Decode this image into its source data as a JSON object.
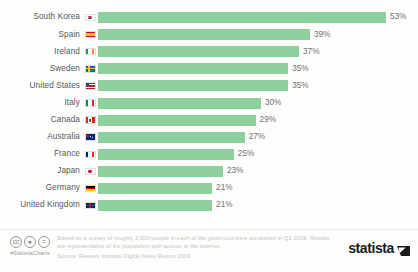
{
  "chart_data": {
    "type": "bar",
    "orientation": "horizontal",
    "title": "",
    "xlabel": "",
    "ylabel": "",
    "xlim": [
      0,
      53
    ],
    "grid": false,
    "legend": false,
    "value_suffix": "%",
    "bar_color": "#8ecf9e",
    "categories": [
      "South Korea",
      "Spain",
      "Ireland",
      "Sweden",
      "United States",
      "Italy",
      "Canada",
      "Australia",
      "France",
      "Japan",
      "Germany",
      "United Kingdom"
    ],
    "values": [
      53,
      39,
      37,
      35,
      35,
      30,
      29,
      27,
      25,
      23,
      21,
      21
    ],
    "value_labels": [
      "53%",
      "39%",
      "37%",
      "35%",
      "35%",
      "30%",
      "29%",
      "27%",
      "25%",
      "23%",
      "21%",
      "21%"
    ],
    "flags": [
      "flag-south-korea",
      "flag-spain",
      "flag-ireland",
      "flag-sweden",
      "flag-united-states",
      "flag-italy",
      "flag-canada",
      "flag-australia",
      "flag-france",
      "flag-japan",
      "flag-germany",
      "flag-united-kingdom"
    ]
  },
  "footer": {
    "cc_icons": [
      "cc-icon",
      "by-icon",
      "nd-icon"
    ],
    "cc_glyphs": [
      "ⓒ",
      "ⓘ",
      "ⓔ"
    ],
    "hashtag": "#StatistaCharts",
    "note": "Based on a survey of roughly 2,000 people in each of the given countries conducted in Q1 2019. Results are representative of the population with access to the internet.",
    "source": "Source: Reuters Institute Digital News Report 2019",
    "brand": "statista"
  }
}
